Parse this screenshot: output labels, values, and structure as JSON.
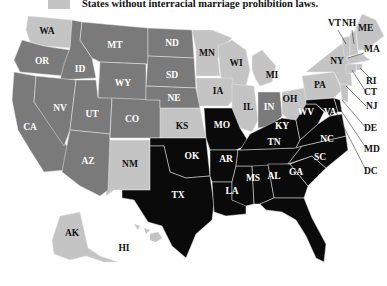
{
  "legend": {
    "label": "States without interracial marriage prohibition laws.",
    "color": "#c4c4c4"
  },
  "colors": {
    "none": "#c4c4c4",
    "repealed": "#7a7a7a",
    "until1967": "#0a0a0a",
    "label_on_dark": "#ffffff",
    "label_on_light": "#111111"
  },
  "states": {
    "WA": "WA",
    "OR": "OR",
    "CA": "CA",
    "ID": "ID",
    "NV": "NV",
    "MT": "MT",
    "WY": "WY",
    "UT": "UT",
    "AZ": "AZ",
    "CO": "CO",
    "NM": "NM",
    "ND": "ND",
    "SD": "SD",
    "NE": "NE",
    "KS": "KS",
    "OK": "OK",
    "TX": "TX",
    "MN": "MN",
    "IA": "IA",
    "MO": "MO",
    "AR": "AR",
    "LA": "LA",
    "WI": "WI",
    "IL": "IL",
    "MI": "MI",
    "IN": "IN",
    "OH": "OH",
    "KY": "KY",
    "TN": "TN",
    "MS": "MS",
    "AL": "AL",
    "GA": "GA",
    "FL": "FL",
    "SC": "SC",
    "NC": "NC",
    "VA": "VA",
    "WV": "WV",
    "PA": "PA",
    "NY": "NY",
    "VT": "VT",
    "NH": "NH",
    "ME": "ME",
    "MA": "MA",
    "RI": "RI",
    "CT": "CT",
    "NJ": "NJ",
    "DE": "DE",
    "MD": "MD",
    "DC": "DC",
    "AK": "AK",
    "HI": "HI"
  }
}
